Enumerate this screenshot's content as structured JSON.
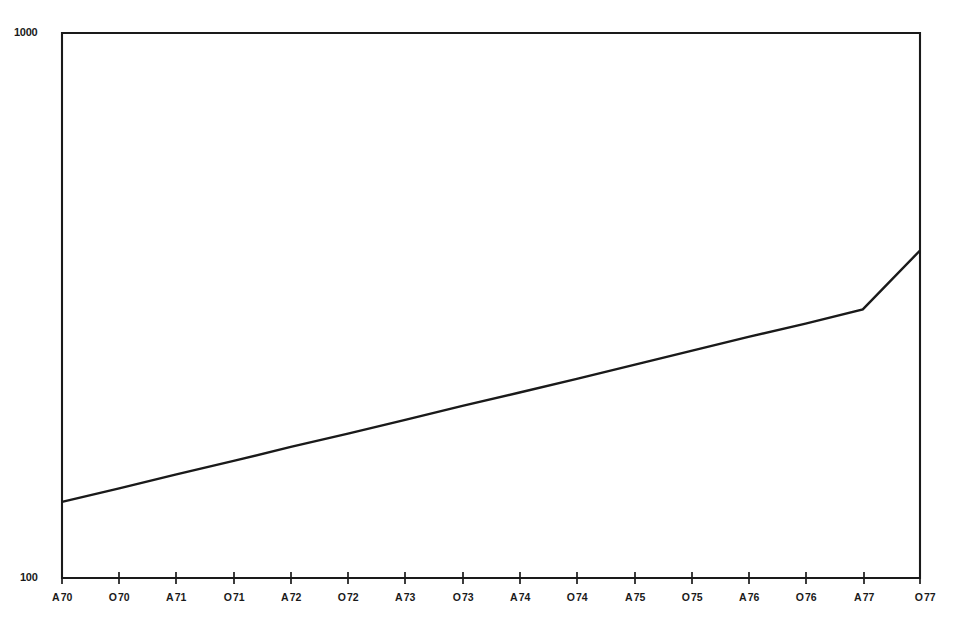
{
  "chart_data": {
    "type": "line",
    "title": "",
    "subtitle": "",
    "xlabel": "",
    "ylabel": "",
    "yscale": "log",
    "ylim": [
      100,
      1000
    ],
    "ytick_labels": [
      "1000",
      "100"
    ],
    "ytick_values": [
      1000,
      100
    ],
    "grid": false,
    "legend": null,
    "x_tick_labels": [
      "A 70",
      "O 70",
      "A 71",
      "O 71",
      "A 72",
      "O 72",
      "A 73",
      "O 73",
      "A 74",
      "O 74",
      "A 75",
      "O 75",
      "A 76",
      "O 76",
      "A 77",
      "O 77"
    ],
    "x_tick_months": [
      "A",
      "O",
      "A",
      "O",
      "A",
      "O",
      "A",
      "O",
      "A",
      "O",
      "A",
      "O",
      "A",
      "O",
      "A",
      "O"
    ],
    "x_tick_years": [
      "70",
      "70",
      "71",
      "71",
      "72",
      "72",
      "73",
      "73",
      "74",
      "74",
      "75",
      "75",
      "76",
      "76",
      "77",
      "77"
    ],
    "categories": [
      "A 70",
      "O 70",
      "A 71",
      "O 71",
      "A 72",
      "O 72",
      "A 73",
      "O 73",
      "A 74",
      "O 74",
      "A 75",
      "O 75",
      "A 76",
      "O 76",
      "A 77",
      "O 77"
    ],
    "series": [
      {
        "name": "trend",
        "style": "solid",
        "color": "#1a1a1a",
        "values": [
          138,
          146,
          155,
          164,
          174,
          184,
          195,
          207,
          219,
          232,
          246,
          261,
          277,
          293,
          311,
          399
        ]
      }
    ],
    "endpoints": {
      "start_label": "A 70",
      "start_value": 138,
      "end_label": "O 77",
      "end_value": 399
    }
  },
  "colors": {
    "ink": "#1a1a1a",
    "line": "#1a1a1a",
    "background": "#ffffff"
  }
}
